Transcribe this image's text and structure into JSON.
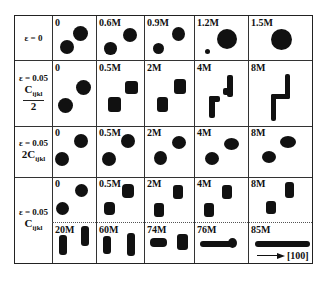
{
  "figure": {
    "rows": [
      {
        "label_lines": [
          "ε = 0"
        ],
        "cells": [
          "0",
          "0.6M",
          "0.9M",
          "1.2M",
          "1.5M"
        ]
      },
      {
        "label_lines": [
          "ε = 0.05",
          "Cijkl",
          "2"
        ],
        "label_format": "fraction",
        "cells": [
          "0",
          "0.5M",
          "2M",
          "4M",
          "8M"
        ]
      },
      {
        "label_lines": [
          "ε = 0.05",
          "2Cijkl"
        ],
        "cells": [
          "0",
          "0.5M",
          "2M",
          "4M",
          "8M"
        ]
      },
      {
        "label_lines": [
          "ε = 0.05",
          "Cijkl"
        ],
        "cells": [
          "0",
          "0.5M",
          "2M",
          "4M",
          "8M"
        ],
        "cells_continued": [
          "20M",
          "60M",
          "74M",
          "76M",
          "85M"
        ]
      }
    ],
    "direction_label": "[100]",
    "labels": {
      "r0": "ε = 0",
      "r1_eps": "ε = 0.05",
      "r1_C": "C",
      "r1_sub": "ijkl",
      "r1_den": "2",
      "r2_eps": "ε = 0.05",
      "r2_C": "2C",
      "r2_sub": "ijkl",
      "r3_eps": "ε = 0.05",
      "r3_C": "C",
      "r3_sub": "ijkl"
    }
  }
}
